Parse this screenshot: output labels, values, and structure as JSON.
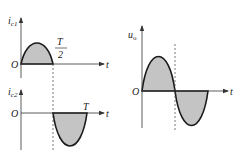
{
  "diagram": {
    "colors": {
      "curve": "#1a1a1a",
      "fill": "#c4c4c4",
      "axis": "#333333",
      "dash": "#555555"
    },
    "plot_top": {
      "y_label": "i",
      "y_label_sub": "c1",
      "origin_label": "O",
      "x_label": "t",
      "annotation_num": "T",
      "annotation_den": "2",
      "waveform": "positive half-cycle (0 to T/2)"
    },
    "plot_bottom": {
      "y_label": "i",
      "y_label_sub": "c2",
      "origin_label": "O",
      "x_label": "t",
      "annotation": "T",
      "waveform": "negative half-cycle (T/2 to T)"
    },
    "plot_right": {
      "y_label": "u",
      "y_label_sub": "o",
      "origin_label": "O",
      "x_label": "t",
      "waveform": "full sine cycle (0 to T)"
    }
  }
}
